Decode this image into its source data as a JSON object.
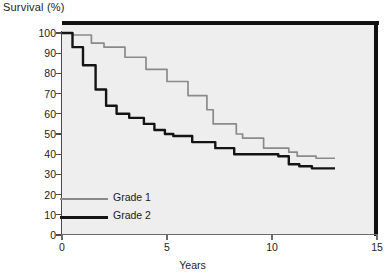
{
  "chart_data": {
    "type": "line",
    "title": "Survival (%)",
    "xlabel": "Years",
    "ylabel": "Survival (%)",
    "xlim": [
      0,
      15
    ],
    "ylim": [
      0,
      100
    ],
    "grid": false,
    "legend_position": "inside-lower-left",
    "x_ticks": [
      0,
      5,
      10,
      15
    ],
    "x_tick_labels": [
      "0",
      "5",
      "10",
      "15"
    ],
    "y_ticks": [
      0,
      10,
      20,
      30,
      40,
      50,
      60,
      70,
      80,
      90,
      100
    ],
    "y_tick_labels": [
      "0",
      "10",
      "20",
      "30",
      "40",
      "50",
      "60",
      "70",
      "80",
      "90",
      "100"
    ],
    "series": [
      {
        "name": "Grade 1",
        "color": "#8a8a8a",
        "style": "step",
        "points": [
          [
            0,
            100
          ],
          [
            0.5,
            99
          ],
          [
            1.4,
            95
          ],
          [
            2.0,
            93
          ],
          [
            3.0,
            88
          ],
          [
            4.0,
            82
          ],
          [
            5.0,
            76
          ],
          [
            6.0,
            69
          ],
          [
            6.9,
            62
          ],
          [
            7.2,
            55
          ],
          [
            8.0,
            55
          ],
          [
            8.3,
            50
          ],
          [
            8.6,
            48
          ],
          [
            9.3,
            48
          ],
          [
            9.6,
            43
          ],
          [
            10.4,
            43
          ],
          [
            10.8,
            41
          ],
          [
            11.2,
            39
          ],
          [
            12.1,
            38
          ],
          [
            13.0,
            38
          ]
        ]
      },
      {
        "name": "Grade 2",
        "color": "#141414",
        "style": "step",
        "points": [
          [
            0,
            100
          ],
          [
            0.5,
            93
          ],
          [
            1.0,
            84
          ],
          [
            1.6,
            72
          ],
          [
            2.1,
            64
          ],
          [
            2.6,
            60
          ],
          [
            3.2,
            58
          ],
          [
            3.9,
            55
          ],
          [
            4.4,
            52
          ],
          [
            4.9,
            50
          ],
          [
            5.3,
            49
          ],
          [
            5.9,
            49
          ],
          [
            6.2,
            46
          ],
          [
            6.9,
            46
          ],
          [
            7.3,
            43
          ],
          [
            7.8,
            43
          ],
          [
            8.2,
            40
          ],
          [
            9.0,
            40
          ],
          [
            9.8,
            40
          ],
          [
            10.3,
            39
          ],
          [
            10.8,
            35
          ],
          [
            11.3,
            34
          ],
          [
            11.9,
            33
          ],
          [
            13.0,
            33
          ]
        ]
      }
    ]
  },
  "legend": {
    "items": [
      {
        "label": "Grade 1"
      },
      {
        "label": "Grade 2"
      }
    ]
  },
  "colors": {
    "grade1": "#8a8a8a",
    "grade2": "#141414",
    "plot_background": "#eeeeee",
    "border": "#111111",
    "axis": "#5a5a5a",
    "text": "#1a1a1a"
  }
}
